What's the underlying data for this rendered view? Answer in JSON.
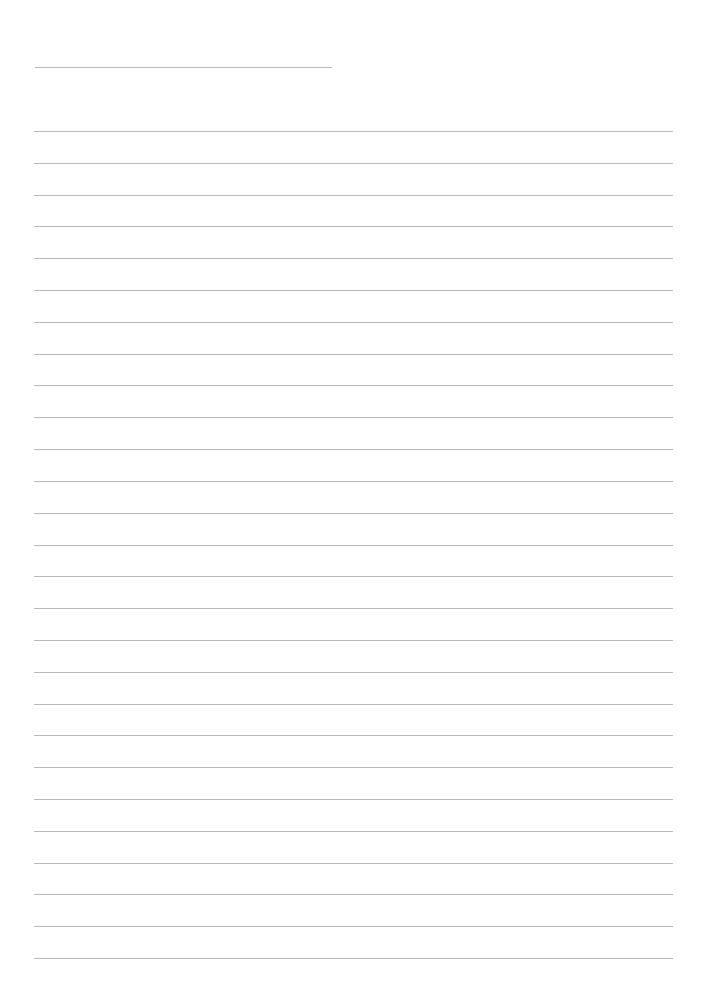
{
  "page": {
    "type": "lined-paper",
    "background": "#ffffff",
    "line_color": "#b9b9b9"
  },
  "header_line": {
    "x_start": 35,
    "x_end": 332,
    "y": 67
  },
  "ruled_lines": {
    "count": 27,
    "x_start": 34,
    "x_end": 673,
    "first_y": 131,
    "last_y": 958,
    "spacing": 31.8
  }
}
